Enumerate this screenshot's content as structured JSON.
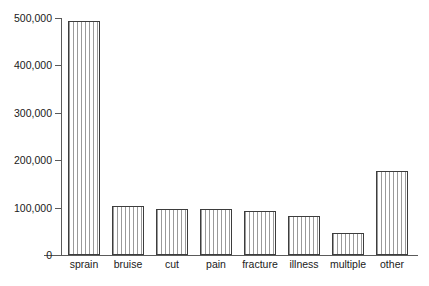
{
  "chart_data": {
    "type": "bar",
    "title": "",
    "subtitle": "",
    "xlabel": "",
    "ylabel": "",
    "categories": [
      "sprain",
      "bruise",
      "cut",
      "pain",
      "fracture",
      "illness",
      "multiple",
      "other"
    ],
    "values": [
      493000,
      103000,
      98000,
      98000,
      92000,
      83000,
      47000,
      178000
    ],
    "ylim": [
      0,
      500000
    ],
    "yticks": [
      0,
      100000,
      200000,
      300000,
      400000,
      500000
    ],
    "ytick_labels": [
      "0",
      "100,000",
      "200,000",
      "300,000",
      "400,000",
      "500,000"
    ],
    "grid": false,
    "legend": null,
    "annotations": [],
    "series": [
      {
        "name": "count",
        "values": [
          493000,
          103000,
          98000,
          98000,
          92000,
          83000,
          47000,
          178000
        ]
      }
    ],
    "style": {
      "bar_fill": "#ffffff",
      "bar_hatch": "vertical-stripes",
      "bar_hatch_color": "#9a9a9a",
      "bar_edge_color": "#3d3d3d",
      "axis_color": "#5a5a5a",
      "text_color": "#1a1a1a",
      "background": "#ffffff"
    }
  }
}
